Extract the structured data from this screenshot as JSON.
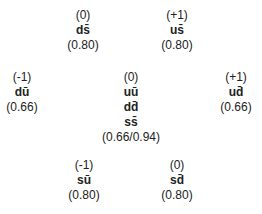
{
  "diagram": {
    "nodes": [
      {
        "id": "ds",
        "charge": "(0)",
        "quarks": [
          "ds̄"
        ],
        "value": "(0.80)",
        "x": 83,
        "y": 8
      },
      {
        "id": "us",
        "charge": "(+1)",
        "quarks": [
          "us̄"
        ],
        "value": "(0.80)",
        "x": 177,
        "y": 8
      },
      {
        "id": "du",
        "charge": "(-1)",
        "quarks": [
          "dū"
        ],
        "value": "(0.66)",
        "x": 22,
        "y": 70
      },
      {
        "id": "center",
        "charge": "(0)",
        "quarks": [
          "uū",
          "dd̄",
          "ss̄"
        ],
        "value": "(0.66/0.94)",
        "x": 131,
        "y": 70
      },
      {
        "id": "ud",
        "charge": "(+1)",
        "quarks": [
          "ud̄"
        ],
        "value": "(0.66)",
        "x": 236,
        "y": 70
      },
      {
        "id": "su",
        "charge": "(-1)",
        "quarks": [
          "sū"
        ],
        "value": "(0.80)",
        "x": 84,
        "y": 158
      },
      {
        "id": "sd",
        "charge": "(0)",
        "quarks": [
          "sd̄"
        ],
        "value": "(0.80)",
        "x": 177,
        "y": 158
      }
    ]
  }
}
